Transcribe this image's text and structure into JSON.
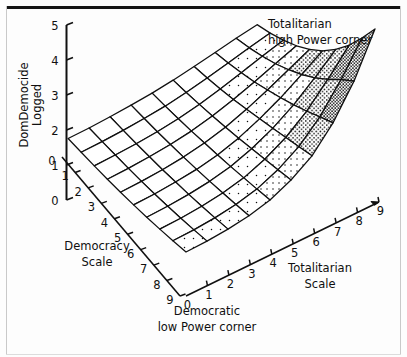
{
  "figure": {
    "background_color": "#fdfdfd",
    "ink_color": "#101010",
    "rule_color": "#141414"
  },
  "chart_data": {
    "type": "surface",
    "title": "",
    "subtitle": "",
    "zlabel_line1": "DomDemocide",
    "zlabel_line2": "Logged",
    "xlabel_line1": "Totalitarian",
    "xlabel_line2": "Scale",
    "ylabel_line1": "Democracy",
    "ylabel_line2": "Scale",
    "zlim": [
      0,
      5
    ],
    "z_ticks": [
      0,
      1,
      2,
      3,
      4,
      5
    ],
    "z_tick_labels": [
      "0",
      "1",
      "2",
      "3",
      "4",
      "5"
    ],
    "xlim": [
      0,
      9
    ],
    "x_ticks": [
      0,
      1,
      2,
      3,
      4,
      5,
      6,
      7,
      8,
      9
    ],
    "x_tick_labels": [
      "0",
      "1",
      "2",
      "3",
      "4",
      "5",
      "6",
      "7",
      "8",
      "9"
    ],
    "ylim": [
      0,
      9
    ],
    "y_ticks": [
      0,
      1,
      2,
      3,
      4,
      5,
      6,
      7,
      8,
      9
    ],
    "y_tick_labels": [
      "0",
      "1",
      "2",
      "3",
      "4",
      "5",
      "6",
      "7",
      "8",
      "9"
    ],
    "grid": true,
    "legend": false,
    "annotations": [
      {
        "name": "totalitarian-high-power-corner",
        "line1": "Totalitarian",
        "line2": "high Power corner"
      },
      {
        "name": "democratic-low-power-corner",
        "line1": "Democratic",
        "line2": "low Power corner"
      }
    ],
    "x_values": [
      0,
      1,
      2,
      3,
      4,
      5,
      6,
      7,
      8,
      9
    ],
    "y_values": [
      0,
      1,
      2,
      3,
      4,
      5,
      6,
      7,
      8,
      9
    ],
    "z_matrix": [
      [
        1.0,
        1.02,
        1.07,
        1.16,
        1.32,
        1.6,
        2.0,
        2.65,
        3.55,
        4.75
      ],
      [
        0.88,
        0.9,
        0.95,
        1.04,
        1.19,
        1.45,
        1.82,
        2.38,
        3.15,
        4.05
      ],
      [
        0.77,
        0.79,
        0.84,
        0.93,
        1.07,
        1.31,
        1.64,
        2.1,
        2.72,
        3.4
      ],
      [
        0.67,
        0.69,
        0.74,
        0.82,
        0.95,
        1.17,
        1.46,
        1.84,
        2.32,
        2.84
      ],
      [
        0.58,
        0.6,
        0.65,
        0.72,
        0.84,
        1.03,
        1.29,
        1.6,
        1.97,
        2.36
      ],
      [
        0.5,
        0.52,
        0.56,
        0.63,
        0.74,
        0.9,
        1.12,
        1.38,
        1.67,
        1.96
      ],
      [
        0.43,
        0.45,
        0.49,
        0.55,
        0.64,
        0.78,
        0.96,
        1.17,
        1.4,
        1.62
      ],
      [
        0.37,
        0.39,
        0.42,
        0.47,
        0.55,
        0.67,
        0.82,
        0.99,
        1.17,
        1.34
      ],
      [
        0.32,
        0.33,
        0.36,
        0.41,
        0.47,
        0.57,
        0.69,
        0.83,
        0.97,
        1.1
      ],
      [
        0.27,
        0.28,
        0.31,
        0.35,
        0.4,
        0.48,
        0.58,
        0.69,
        0.8,
        0.9
      ]
    ],
    "shading": "stipple-density-by-height"
  }
}
